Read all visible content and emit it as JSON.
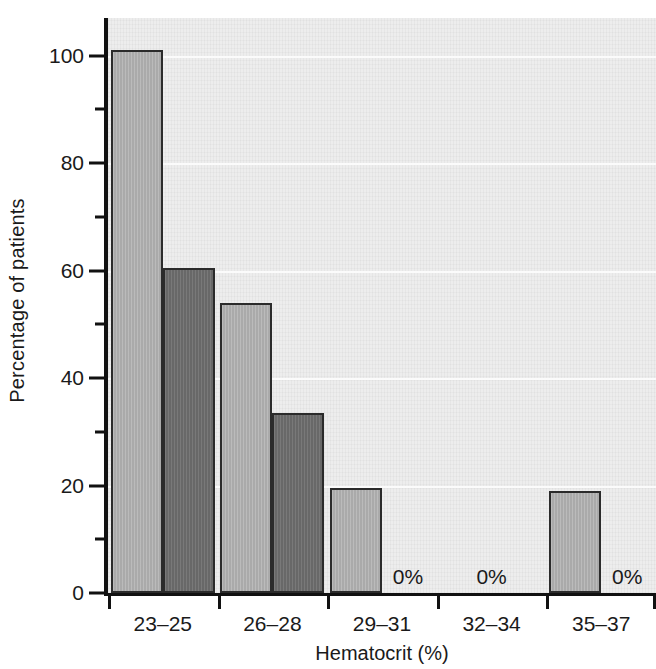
{
  "chart_data": {
    "type": "bar",
    "title": "",
    "subtitle": "",
    "xlabel": "Hematocrit (%)",
    "ylabel": "Percentage of patients",
    "categories": [
      "23–25",
      "26–28",
      "29–31",
      "32–34",
      "35–37"
    ],
    "series": [
      {
        "name": "series-light",
        "color": "#b3b3b3",
        "values": [
          101,
          54,
          19.5,
          0,
          19
        ]
      },
      {
        "name": "series-dark",
        "color": "#6f6f6f",
        "values": [
          60.5,
          33.5,
          0,
          0,
          0
        ]
      }
    ],
    "ylim": [
      0,
      107
    ],
    "xlim": [
      0,
      5
    ],
    "y_major_ticks": [
      0,
      20,
      40,
      60,
      80,
      100
    ],
    "y_minor_ticks": [
      10,
      30,
      50,
      70,
      90
    ],
    "y_tick_labels": [
      "0",
      "20",
      "40",
      "60",
      "80",
      "100"
    ],
    "grid": "horizontal",
    "legend": "none",
    "annotations": [
      {
        "text": "0%",
        "category": "29–31",
        "value": 0
      },
      {
        "text": "0%",
        "category": "32–34",
        "value": 0
      },
      {
        "text": "0%",
        "category": "35–37",
        "value": 0
      }
    ],
    "plot_background": "#ededed",
    "axis_color": "#111111"
  }
}
